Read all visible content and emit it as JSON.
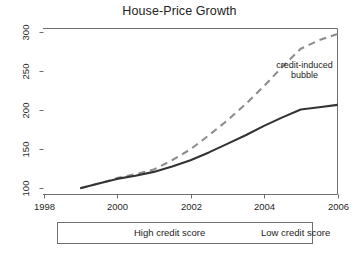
{
  "chart_data": {
    "type": "line",
    "title": "House-Price Growth",
    "xlabel": "",
    "ylabel": "",
    "xlim": [
      1998,
      2006
    ],
    "ylim": [
      92,
      305
    ],
    "grid": false,
    "legend_position": "below-axis",
    "xticks": [
      "1998",
      "2000",
      "2002",
      "2004",
      "2006"
    ],
    "xtick_values": [
      1998,
      2000,
      2002,
      2004,
      2006
    ],
    "yticks": [
      "100",
      "150",
      "200",
      "250",
      "300"
    ],
    "ytick_values": [
      100,
      150,
      200,
      250,
      300
    ],
    "x": [
      1999,
      1999.5,
      2000,
      2000.5,
      2001,
      2001.5,
      2002,
      2002.5,
      2003,
      2003.5,
      2004,
      2004.5,
      2005,
      2005.5,
      2006
    ],
    "series": [
      {
        "name": "High credit score",
        "style": "solid",
        "color": "#333333",
        "values": [
          100,
          106,
          112,
          116,
          121,
          128,
          136,
          146,
          157,
          168,
          180,
          191,
          201,
          204,
          207
        ]
      },
      {
        "name": "Low credit score",
        "style": "dashed",
        "color": "#8c8c8c",
        "values": [
          100,
          106,
          113,
          118,
          124,
          136,
          150,
          168,
          187,
          208,
          231,
          256,
          279,
          290,
          298
        ]
      }
    ],
    "annotations": [
      {
        "name": "credit-induced-bubble",
        "line1": "credit-induced",
        "line2": "bubble",
        "x": 2005.1,
        "y": 252
      }
    ]
  },
  "legend": {
    "entries": [
      {
        "label": "High credit score",
        "style": "solid",
        "color": "#333333"
      },
      {
        "label": "Low credit score",
        "style": "dashed",
        "color": "#8c8c8c"
      }
    ]
  },
  "colors": {
    "high_credit": "#333333",
    "low_credit": "#8c8c8c",
    "axis": "#6f6f6f",
    "text": "#1f1f1f",
    "background": "#ffffff"
  }
}
